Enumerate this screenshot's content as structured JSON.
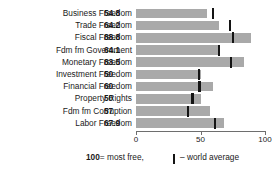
{
  "title_sliver": "Economic Freedoms",
  "chart_data": {
    "type": "bar",
    "orientation": "horizontal",
    "title": "",
    "xlabel": "",
    "ylabel": "",
    "xlim": [
      0,
      100
    ],
    "xticks": [
      0,
      50,
      100
    ],
    "xtick_labels": [
      "0",
      "50",
      "100"
    ],
    "grid": false,
    "bar_color": "#a9a9a9",
    "marker_color": "#141414",
    "categories": [
      "Business Freedom",
      "Trade Freedom",
      "Fiscal Freedom",
      "Fdm fm Government",
      "Monetary Freedom",
      "Investment Freedom",
      "Financial Freedom",
      "Property Rights",
      "Fdm fm Corruption",
      "Labor Freedom"
    ],
    "values": [
      54.8,
      64.2,
      88.8,
      64.1,
      83.5,
      50,
      60,
      50,
      57,
      67.9
    ],
    "value_labels": [
      "54.8",
      "64.2",
      "88.8",
      "64.1",
      "83.5",
      "50",
      "60",
      "50",
      "57",
      "67.9"
    ],
    "series": [
      {
        "name": "country score",
        "values": [
          54.8,
          64.2,
          88.8,
          64.1,
          83.5,
          50,
          60,
          50,
          57,
          67.9
        ]
      },
      {
        "name": "world average",
        "values": [
          59.5,
          72.8,
          75.2,
          64.5,
          73.9,
          48.8,
          49.2,
          43.8,
          40.5,
          61.4
        ]
      }
    ],
    "legend": {
      "position": "bottom",
      "entries": [
        "100 = most free,",
        "world average"
      ]
    }
  },
  "legend": {
    "most_free_value": "100",
    "most_free_text": "= most free,",
    "world_average_dash": "–",
    "world_average_text": "world average"
  }
}
